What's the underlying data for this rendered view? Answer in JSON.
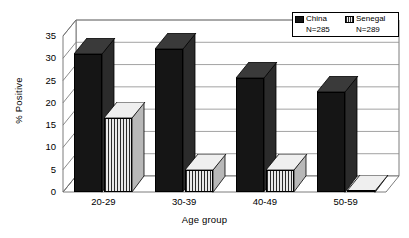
{
  "chart_data": {
    "type": "bar",
    "title": "",
    "xlabel": "Age group",
    "ylabel": "% Positive",
    "categories": [
      "20-29",
      "30-39",
      "40-49",
      "50-59"
    ],
    "series": [
      {
        "name": "China",
        "n_label": "N=285",
        "values": [
          31.0,
          32.0,
          25.5,
          22.5
        ],
        "color": "#151515",
        "pattern": "solid"
      },
      {
        "name": "Senegal",
        "n_label": "N=289",
        "values": [
          16.6,
          5.0,
          4.9,
          0.3
        ],
        "color": "#d8d8d8",
        "pattern": "vertical-stripes"
      }
    ],
    "ylim": [
      0,
      35
    ],
    "yticks": [
      0,
      5,
      10,
      15,
      20,
      25,
      30,
      35
    ],
    "ytick_labels": [
      "0",
      "5",
      "10",
      "15",
      "20",
      "25",
      "30",
      "35"
    ],
    "grid": "horizontal",
    "legend_position": "top-right",
    "style": "3d-perspective"
  },
  "legend": {
    "entries": [
      {
        "label": "China",
        "n": "N=285",
        "swatch": "solid-black-swatch"
      },
      {
        "label": "Senegal",
        "n": "N=289",
        "swatch": "striped-swatch"
      }
    ]
  }
}
